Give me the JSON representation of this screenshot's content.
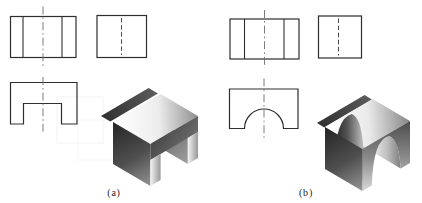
{
  "canvas": {
    "width": 422,
    "height": 203,
    "background": "#ffffff"
  },
  "style": {
    "outline_color": "#2e2e2e",
    "outline_width": 1.2,
    "inner_line_width": 1.1,
    "centerline_color": "#6e6e6e",
    "centerline_dash": "8 3 1.6 3",
    "centerline_width": 0.9,
    "hidden_color": "#4a4a4a",
    "hidden_dash": "4.5 2.6",
    "hidden_width": 1,
    "label_color": "#1c1c1c",
    "label_font_size": 10,
    "label_letter_spacing": 0.8
  },
  "labels": [
    {
      "name": "label-a",
      "text": "(a)",
      "x": 114,
      "y": 196
    },
    {
      "name": "label-b",
      "text": "(b)",
      "x": 306,
      "y": 196
    }
  ],
  "gradients": [
    {
      "id": "gaBand",
      "x1": 101,
      "y1": 116,
      "x2": 158,
      "y2": 94,
      "stops": [
        [
          0,
          "#2f2f2f"
        ],
        [
          1,
          "#5d5d5d"
        ]
      ]
    },
    {
      "id": "gaTop",
      "x1": 118,
      "y1": 120,
      "x2": 200,
      "y2": 116,
      "stops": [
        [
          0,
          "#ffffff"
        ],
        [
          0.5,
          "#ececec"
        ],
        [
          1,
          "#8a8a8a"
        ]
      ]
    },
    {
      "id": "gaFront",
      "x1": 150,
      "y1": 118,
      "x2": 200,
      "y2": 152,
      "stops": [
        [
          0,
          "#383838"
        ],
        [
          1,
          "#787878"
        ]
      ]
    },
    {
      "id": "gaLeft",
      "x1": 115,
      "y1": 122,
      "x2": 152,
      "y2": 186,
      "stops": [
        [
          0,
          "#262626"
        ],
        [
          0.55,
          "#4f4f4f"
        ],
        [
          1,
          "#949494"
        ]
      ]
    },
    {
      "id": "gaGap",
      "x1": 150,
      "y1": 116,
      "x2": 190,
      "y2": 164,
      "stops": [
        [
          0,
          "#4c4c4c"
        ],
        [
          1,
          "#a2a2a2"
        ]
      ]
    },
    {
      "id": "gaStripe1",
      "x1": 150.4,
      "y1": 160,
      "x2": 160.6,
      "y2": 160,
      "stops": [
        [
          0,
          "#f4f4f4"
        ],
        [
          1,
          "#979797"
        ]
      ]
    },
    {
      "id": "gaStripe2",
      "x1": 187.8,
      "y1": 140,
      "x2": 198,
      "y2": 140,
      "stops": [
        [
          0,
          "#f4f4f4"
        ],
        [
          1,
          "#979797"
        ]
      ]
    },
    {
      "id": "gbBand",
      "x1": 317,
      "y1": 123,
      "x2": 372,
      "y2": 99,
      "stops": [
        [
          0,
          "#2f2f2f"
        ],
        [
          1,
          "#5d5d5d"
        ]
      ]
    },
    {
      "id": "gbTop",
      "x1": 330,
      "y1": 125,
      "x2": 408,
      "y2": 120,
      "stops": [
        [
          0,
          "#ffffff"
        ],
        [
          0.5,
          "#e9e9e9"
        ],
        [
          1,
          "#8a8a8a"
        ]
      ]
    },
    {
      "id": "gbLeft",
      "x1": 327,
      "y1": 128,
      "x2": 364,
      "y2": 189,
      "stops": [
        [
          0,
          "#262626"
        ],
        [
          0.55,
          "#4f4f4f"
        ],
        [
          1,
          "#949494"
        ]
      ]
    },
    {
      "id": "gbFront",
      "x1": 386,
      "y1": 112,
      "x2": 386,
      "y2": 195,
      "stops": [
        [
          0,
          "#3d3d3d"
        ],
        [
          0.55,
          "#8a8a8a"
        ],
        [
          1,
          "#e2e2e2"
        ]
      ]
    },
    {
      "id": "gbCyl",
      "x1": 334,
      "y1": 150,
      "x2": 401,
      "y2": 150,
      "stops": [
        [
          0,
          "#252525"
        ],
        [
          0.2,
          "#555555"
        ],
        [
          0.55,
          "#f2f2f2"
        ],
        [
          0.8,
          "#bdbdbd"
        ],
        [
          1,
          "#7d7d7d"
        ]
      ]
    }
  ],
  "background_artifacts": [
    {
      "name": "ghost-box-1",
      "x": 57,
      "y": 97,
      "w": 46,
      "h": 46,
      "stroke": "#f0f0f0"
    },
    {
      "name": "ghost-box-2",
      "x": 78,
      "y": 120,
      "w": 45,
      "h": 40,
      "stroke": "#f1f1f1"
    }
  ],
  "ortho_views": [
    {
      "name": "top-view-a",
      "shapes": [
        {
          "kind": "rect",
          "x": 10.5,
          "y": 16.5,
          "w": 65.5,
          "h": 41,
          "stroke": "outline"
        },
        {
          "kind": "line",
          "x1": 23,
          "y1": 16.5,
          "x2": 23,
          "y2": 57.5,
          "stroke": "inner"
        },
        {
          "kind": "line",
          "x1": 62,
          "y1": 16.5,
          "x2": 62,
          "y2": 57.5,
          "stroke": "inner"
        },
        {
          "kind": "line",
          "x1": 43,
          "y1": 6.5,
          "x2": 43,
          "y2": 67.5,
          "stroke": "centerline"
        }
      ]
    },
    {
      "name": "side-view-a",
      "shapes": [
        {
          "kind": "rect",
          "x": 97,
          "y": 15.5,
          "w": 49.5,
          "h": 42,
          "stroke": "outline"
        },
        {
          "kind": "line",
          "x1": 121.5,
          "y1": 18,
          "x2": 121.5,
          "y2": 55,
          "stroke": "hidden"
        }
      ]
    },
    {
      "name": "front-view-a",
      "shapes": [
        {
          "kind": "path",
          "d": "M10.5,82.5 L77,82.5 L77,124 L61.5,124 L61.5,103.5 L23.5,103.5 L23.5,124 L10.5,124 Z",
          "stroke": "outline"
        },
        {
          "kind": "line",
          "x1": 43,
          "y1": 77,
          "x2": 43,
          "y2": 134,
          "stroke": "centerline"
        }
      ]
    },
    {
      "name": "top-view-b",
      "shapes": [
        {
          "kind": "rect",
          "x": 230,
          "y": 19,
          "w": 69,
          "h": 40,
          "stroke": "outline"
        },
        {
          "kind": "line",
          "x1": 244.5,
          "y1": 19,
          "x2": 244.5,
          "y2": 59,
          "stroke": "inner"
        },
        {
          "kind": "line",
          "x1": 284,
          "y1": 19,
          "x2": 284,
          "y2": 59,
          "stroke": "inner"
        },
        {
          "kind": "line",
          "x1": 264.5,
          "y1": 10,
          "x2": 264.5,
          "y2": 68,
          "stroke": "centerline"
        }
      ]
    },
    {
      "name": "side-view-b",
      "shapes": [
        {
          "kind": "rect",
          "x": 318.5,
          "y": 16,
          "w": 43,
          "h": 42,
          "stroke": "outline"
        },
        {
          "kind": "line",
          "x1": 338.5,
          "y1": 18.5,
          "x2": 338.5,
          "y2": 55.5,
          "stroke": "hidden"
        }
      ]
    },
    {
      "name": "front-view-b",
      "shapes": [
        {
          "kind": "path",
          "d": "M229.5,89 L298,89 L298,128.5 L283.5,128.5 A19.5,19.5 0 0 0 244.5,128.5 L229.5,128.5 Z",
          "stroke": "outline"
        },
        {
          "kind": "line",
          "x1": 264,
          "y1": 78.5,
          "x2": 264,
          "y2": 138.5,
          "stroke": "centerline"
        }
      ]
    }
  ],
  "iso_views": [
    {
      "name": "isometric-view-a",
      "shapes": [
        {
          "kind": "polygon",
          "part": "slot-inner-wall",
          "points": "150.4,116 187.8,138 187.8,164 150.4,142",
          "fill": "gaGap"
        },
        {
          "kind": "polygon",
          "part": "back-top-band",
          "points": "101,116 148.6,88 157.9,93.5 110.3,121.5",
          "fill": "gaBand"
        },
        {
          "kind": "polygon",
          "part": "top-face",
          "points": "113,122 160.6,94 198,116 150.4,144",
          "fill": "gaTop"
        },
        {
          "kind": "polygon",
          "part": "front-upper-band",
          "points": "150.4,144 198,116 198,132 150.4,160",
          "fill": "gaFront"
        },
        {
          "kind": "polygon",
          "part": "left-face",
          "points": "113,122 150.4,144 150.4,186 113,164",
          "fill": "gaLeft"
        },
        {
          "kind": "polygon",
          "part": "near-leg-face",
          "points": "150.4,160 160.6,154 160.6,180 150.4,186",
          "fill": "gaStripe1"
        },
        {
          "kind": "polygon",
          "part": "far-leg-face",
          "points": "187.8,138 198,132 198,158 187.8,164",
          "fill": "gaStripe2"
        }
      ]
    },
    {
      "name": "isometric-view-b",
      "shapes": [
        {
          "kind": "polygon",
          "part": "back-top-band",
          "points": "317,123 364.6,95 371.9,99.5 324.3,127.5",
          "fill": "gbBand"
        },
        {
          "kind": "polygon",
          "part": "top-face",
          "points": "325,127 372.6,99 410,121 362.4,149",
          "fill": "gbTop"
        },
        {
          "kind": "path",
          "part": "cylindrical-slot-surface",
          "d": "M334.4,163.5 Q335.5,118 351.8,114 Q361,117 363.3,146.5 L400.7,168.5 Q398.5,139 389.2,136 Q373,139.5 371.8,185.5 Z",
          "fill": "gbCyl"
        },
        {
          "kind": "path",
          "part": "front-face",
          "d": "M362.4,149 L410,121 L410,163 L400.7,168.5 Q398.5,139 389.2,136 Q373,139.5 371.8,185.5 L362.4,191 Z",
          "fill": "gbFront"
        },
        {
          "kind": "polygon",
          "part": "left-face",
          "points": "325,127 362.4,149 362.4,191 325,169",
          "fill": "gbLeft"
        }
      ]
    }
  ]
}
